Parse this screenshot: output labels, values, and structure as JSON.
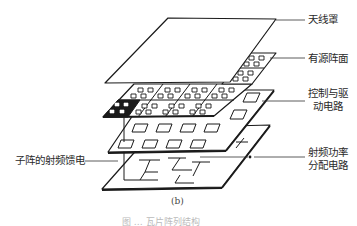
{
  "figure": {
    "subfigure_label": "(b)",
    "caption_partial": "图 … 瓦片阵列结构",
    "labels": {
      "radome": "天线罩",
      "active_array": "有源阵面",
      "control_driver_line1": "控制与驱",
      "control_driver_line2": "动电路",
      "rf_power_line1": "射频功率",
      "rf_power_line2": "分配电路",
      "subarray_rf_feed": "子阵的射频馈电"
    },
    "layers": [
      {
        "name": "radome",
        "order": 1
      },
      {
        "name": "active array face",
        "order": 2
      },
      {
        "name": "control and drive circuit",
        "order": 3
      },
      {
        "name": "RF power distribution circuit",
        "order": 4
      }
    ]
  }
}
